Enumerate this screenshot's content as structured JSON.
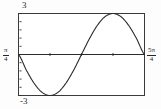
{
  "chart_data": {
    "type": "line",
    "title": "",
    "subtitle": "",
    "xlabel": "",
    "ylabel": "",
    "grid": false,
    "legend": null,
    "xlim": [
      0.7853981634,
      3.926990817
    ],
    "ylim": [
      -3,
      3
    ],
    "x_tick_labels": {
      "min": {
        "numerator": "π",
        "denominator": "4",
        "text": "π/4"
      },
      "max": {
        "numerator": "5π",
        "denominator": "4",
        "text": "5π/4"
      }
    },
    "y_tick_labels": {
      "max": "3",
      "min": "-3"
    },
    "y_tick_count": 11,
    "x_tick_count": 5,
    "axis_line_y": 0,
    "series": [
      {
        "name": "curve",
        "color": "#2b2b2b",
        "function": "3*sin(x - pi/4) reflected: starts at 0, minimum -3, zero crossing, maximum +3",
        "x": [
          0.785,
          0.982,
          1.178,
          1.374,
          1.571,
          1.767,
          1.963,
          2.16,
          2.356,
          2.553,
          2.749,
          2.945,
          3.142,
          3.338,
          3.534,
          3.731,
          3.927
        ],
        "y": [
          0.0,
          -1.148,
          -2.121,
          -2.772,
          -3.0,
          -2.772,
          -2.121,
          -1.148,
          0.0,
          1.148,
          2.121,
          2.772,
          3.0,
          2.772,
          2.121,
          1.148,
          0.0
        ]
      }
    ]
  },
  "plot": {
    "frame_color": "#3a3a3a",
    "curve_color": "#2b2b2b",
    "axis_color": "#2b2b2b",
    "background": "#ffffff"
  }
}
